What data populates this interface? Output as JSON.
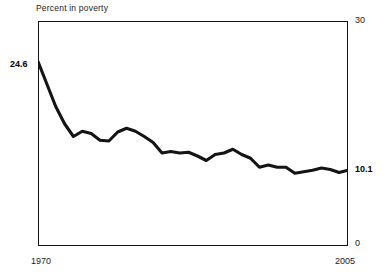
{
  "chart_data": {
    "type": "line",
    "title": "Percent in poverty",
    "xlabel": "",
    "ylabel": "",
    "ylim": [
      0,
      30
    ],
    "xlim": [
      1970,
      2005
    ],
    "grid": false,
    "legend": null,
    "y_tick_labels": [
      "30",
      "0"
    ],
    "x_tick_labels": [
      "1970",
      "2005"
    ],
    "annotations": [
      {
        "name": "start-value",
        "text": "24.6",
        "x": 1970,
        "y": 24.6
      },
      {
        "name": "end-value",
        "text": "10.1",
        "x": 2005,
        "y": 10.1
      }
    ],
    "series": [
      {
        "name": "Percent in poverty",
        "color": "#141414",
        "x": [
          1970,
          1971,
          1972,
          1973,
          1974,
          1975,
          1976,
          1977,
          1978,
          1979,
          1980,
          1981,
          1982,
          1983,
          1984,
          1985,
          1986,
          1987,
          1988,
          1989,
          1990,
          1991,
          1992,
          1993,
          1994,
          1995,
          1996,
          1997,
          1998,
          1999,
          2000,
          2001,
          2002,
          2003,
          2004,
          2005
        ],
        "values": [
          24.6,
          21.6,
          18.6,
          16.3,
          14.6,
          15.3,
          15.0,
          14.1,
          14.0,
          15.2,
          15.7,
          15.3,
          14.6,
          13.8,
          12.4,
          12.6,
          12.4,
          12.5,
          12.0,
          11.4,
          12.2,
          12.4,
          12.9,
          12.2,
          11.7,
          10.5,
          10.8,
          10.5,
          10.5,
          9.7,
          9.9,
          10.1,
          10.4,
          10.2,
          9.8,
          10.1
        ]
      }
    ]
  },
  "chart": {
    "title": "Percent in poverty",
    "y_top": "30",
    "y_bottom": "0",
    "x_start": "1970",
    "x_end": "2005",
    "start_value": "24.6",
    "end_value": "10.1"
  }
}
